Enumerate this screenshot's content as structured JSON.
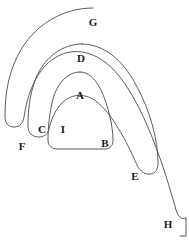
{
  "diagram": {
    "background_color": "#ffffff",
    "stroke_color": "#4a4a4a",
    "label_color": "#1a1a1a",
    "curve_count": 4,
    "labels": [
      {
        "text": "G",
        "x": 93,
        "y": 22
      },
      {
        "text": "D",
        "x": 81,
        "y": 58
      },
      {
        "text": "A",
        "x": 80,
        "y": 95
      },
      {
        "text": "C",
        "x": 42,
        "y": 129
      },
      {
        "text": "I",
        "x": 63,
        "y": 129
      },
      {
        "text": "B",
        "x": 105,
        "y": 143
      },
      {
        "text": "F",
        "x": 22,
        "y": 146
      },
      {
        "text": "E",
        "x": 135,
        "y": 176
      },
      {
        "text": "H",
        "x": 168,
        "y": 224
      }
    ],
    "curves": [
      {
        "name": "inner-curve-a-b-i",
        "path": "M 80 72 C 67 72 57 84 53 99 C 49 114 48 130 48 140 C 48 146 52 149 58 149 L 104 149 C 110 149 113 146 113 140 C 113 126 108 105 101 90 C 95 78 88 72 80 72 Z"
      },
      {
        "name": "middle-curve-d-c-e",
        "path": "M 82 44 C 62 44 44 58 36 78 C 29 96 28 112 28 126 C 28 133 32 137 39 137 C 44 137 48 134 49 129 C 51 120 55 110 62 103 C 72 93 86 93 97 102 C 112 114 126 140 137 165 C 140 172 146 175 151 174 C 156 173 158 169 158 163 C 158 140 150 110 136 85 C 122 58 102 44 82 44 Z"
      },
      {
        "name": "outer-curve-g-f-h",
        "path": "M 93 8 C 63 8 37 24 22 48 C 9 69 5 92 5 116 C 5 123 8 127 14 127 C 20 127 23 123 24 117 C 27 96 34 78 45 66 C 62 48 85 47 105 62 C 132 82 157 140 176 210 C 178 217 182 220 186 218"
      },
      {
        "name": "outer-curve-right-edge",
        "path": "M 186 218 L 186 236 L 180 236"
      }
    ]
  }
}
